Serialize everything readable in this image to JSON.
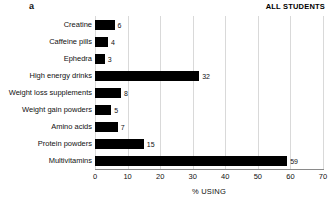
{
  "panel": {
    "letter": "a"
  },
  "header": {
    "title": "ALL STUDENTS"
  },
  "axis": {
    "xlabel": "% USING",
    "ticks": [
      "0",
      "10",
      "20",
      "30",
      "40",
      "50",
      "60",
      "70"
    ]
  },
  "colors": {
    "bar": "#000000",
    "gridline": "#d9d9d9",
    "axis": "#8a8a8a",
    "text": "#111111",
    "background": "#ffffff"
  },
  "chart_data": {
    "type": "bar",
    "orientation": "horizontal",
    "title": "ALL STUDENTS",
    "panel_label": "a",
    "xlabel": "% USING",
    "ylabel": "",
    "xlim": [
      0,
      70
    ],
    "xticks": [
      0,
      10,
      20,
      30,
      40,
      50,
      60,
      70
    ],
    "grid": "vertical",
    "legend": "none",
    "categories": [
      "Creatine",
      "Caffeine pills",
      "Ephedra",
      "High energy drinks",
      "Weight loss supplements",
      "Weight gain powders",
      "Amino acids",
      "Protein powders",
      "Multivitamins"
    ],
    "values": [
      6,
      4,
      3,
      32,
      8,
      5,
      7,
      15,
      59
    ],
    "value_labels": [
      "6",
      "4",
      "3",
      "32",
      "8",
      "5",
      "7",
      "15",
      "59"
    ]
  }
}
